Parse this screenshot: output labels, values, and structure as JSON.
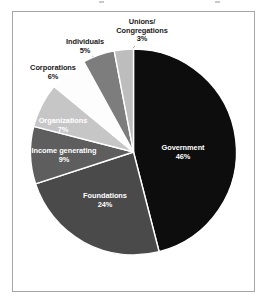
{
  "figure": {
    "background_color": "#ffffff",
    "frame_color": "#a6a6a6"
  },
  "chart_data": {
    "type": "pie",
    "title": "",
    "subtitle": "",
    "xlabel": "",
    "ylabel": "",
    "legend": "none",
    "grid": false,
    "value_unit": "percent",
    "total": 100,
    "start_angle_deg": 0,
    "direction": "clockwise",
    "categories": [
      "Government",
      "Foundations",
      "Income generating",
      "Organizations",
      "Corporations",
      "Individuals",
      "Unions/ Congregations"
    ],
    "values": [
      46,
      24,
      9,
      7,
      6,
      5,
      3
    ],
    "slices": [
      {
        "label": "Government",
        "label_line1": "Government",
        "value": 46,
        "pct_text": "46%",
        "color": "#0d0d0d",
        "label_position": "inside",
        "label_color": "#ffffff"
      },
      {
        "label": "Foundations",
        "label_line1": "Foundations",
        "value": 24,
        "pct_text": "24%",
        "color": "#4a4a4a",
        "label_position": "inside",
        "label_color": "#ffffff"
      },
      {
        "label": "Income generating",
        "label_line1": "Income generating",
        "value": 9,
        "pct_text": "9%",
        "color": "#5e5e5e",
        "label_position": "inside",
        "label_color": "#ffffff"
      },
      {
        "label": "Organizations",
        "label_line1": "Organizations",
        "value": 7,
        "pct_text": "7%",
        "color": "#c6c6c6",
        "label_position": "inside",
        "label_color": "#1a1a1a"
      },
      {
        "label": "Corporations",
        "label_line1": "Corporations",
        "value": 6,
        "pct_text": "6%",
        "color": "#fdfdfd",
        "label_position": "outside",
        "label_color": "#1a1a1a"
      },
      {
        "label": "Individuals",
        "label_line1": "Individuals",
        "value": 5,
        "pct_text": "5%",
        "color": "#7d7d7d",
        "label_position": "outside",
        "label_color": "#1a1a1a"
      },
      {
        "label": "Unions/ Congregations",
        "label_line1": "Unions/",
        "label_line2": "Congregations",
        "value": 3,
        "pct_text": "3%",
        "color": "#bdbdbd",
        "label_position": "outside",
        "label_color": "#1a1a1a"
      }
    ]
  }
}
